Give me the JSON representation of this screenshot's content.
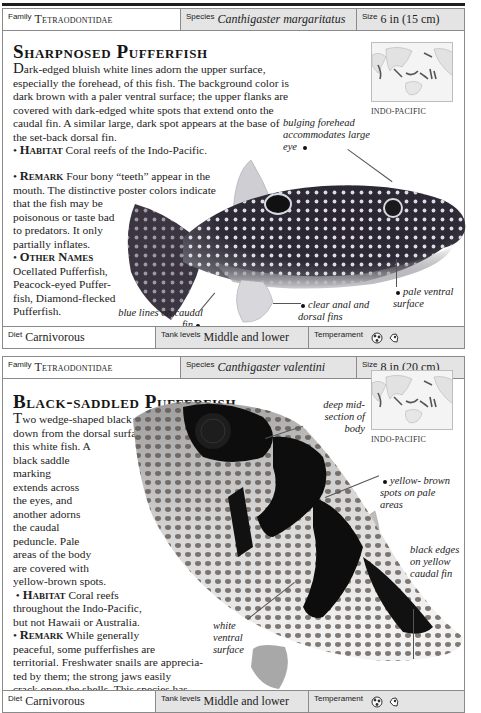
{
  "entries": [
    {
      "header": {
        "family_label": "Family",
        "family": "Tetraodontidae",
        "species_label": "Species",
        "species": "Canthigaster margaritatus",
        "size_label": "Size",
        "size": "6 in (15 cm)"
      },
      "title": "Sharpnosed Pufferfish",
      "description_dropcap": "D",
      "description": "ark-edged bluish white lines adorn the upper surface, especially the forehead, of this fish. The background color is dark brown with a paler ventral surface; the upper flanks are covered with dark-edged white spots that extend onto the caudal fin. A similar large, dark spot appears at the base of the set-back dorsal fin.",
      "habitat_label": "Habitat",
      "habitat": "Coral reefs of the Indo-Pacific.",
      "remark_label": "Remark",
      "remark_lines": [
        "Four bony “teeth” appear in the",
        "mouth. The distinctive poster colors indicate",
        "that the fish may be",
        "poisonous or taste bad",
        "to predators. It only",
        "partially inflates."
      ],
      "other_names_label": "Other Names",
      "other_names_lines": [
        "Ocellated Pufferfish,",
        "Peacock-eyed Puffer-",
        "fish, Diamond-flecked",
        "Pufferfish."
      ],
      "map_label": "INDO-PACIFIC",
      "callouts": [
        "bulging forehead accommodates large eye",
        "pale ventral surface",
        "clear anal and dorsal fins",
        "blue lines on caudal fin"
      ],
      "footer": {
        "diet_label": "Diet",
        "diet": "Carnivorous",
        "tank_label": "Tank levels",
        "tank": "Middle and lower",
        "temperament_label": "Temperament",
        "temperament_icons": [
          "territorial-fish-icon",
          "semi-aggressive-fish-icon"
        ]
      }
    },
    {
      "header": {
        "family_label": "Family",
        "family": "Tetraodontidae",
        "species_label": "Species",
        "species": "Canthigaster valentini",
        "size_label": "Size",
        "size": "8 in (20 cm)"
      },
      "title": "Black-saddled Pufferfish",
      "description_dropcap": "T",
      "description_lines": [
        "wo wedge-shaped black markings extend",
        "down from the dorsal surface of",
        "this white fish. A",
        "black saddle",
        "marking",
        "extends across",
        "the eyes, and",
        "another adorns",
        "the caudal",
        "peduncle. Pale",
        "areas of the body",
        "are covered with",
        "yellow-brown spots."
      ],
      "habitat_label": "Habitat",
      "habitat_lines": [
        "Coral reefs",
        "throughout the Indo-Pacific,",
        "but not Hawaii or Australia."
      ],
      "remark_label": "Remark",
      "remark_lines": [
        "While generally",
        "peaceful, some pufferfishes are",
        "territorial. Freshwater snails are apprecia-",
        "ted by them; the strong jaws easily",
        "crack open the shells. This species has",
        "been considered by some observers to",
        "be synonymous with"
      ],
      "remark_italic_tail": "Canthigaster cinctus",
      "remark_end": ".",
      "map_label": "INDO-PACIFIC",
      "callouts": [
        "deep mid- section of body",
        "yellow- brown spots on pale areas",
        "black edges on yellow caudal fin",
        "white ventral surface"
      ],
      "footer": {
        "diet_label": "Diet",
        "diet": "Carnivorous",
        "tank_label": "Tank levels",
        "tank": "Middle and lower",
        "temperament_label": "Temperament",
        "temperament_icons": [
          "territorial-fish-icon",
          "semi-aggressive-fish-icon"
        ]
      }
    }
  ],
  "colors": {
    "header_bg": "#e4e4e4",
    "border": "#8a8a8a",
    "rule": "#1e1e1e"
  }
}
